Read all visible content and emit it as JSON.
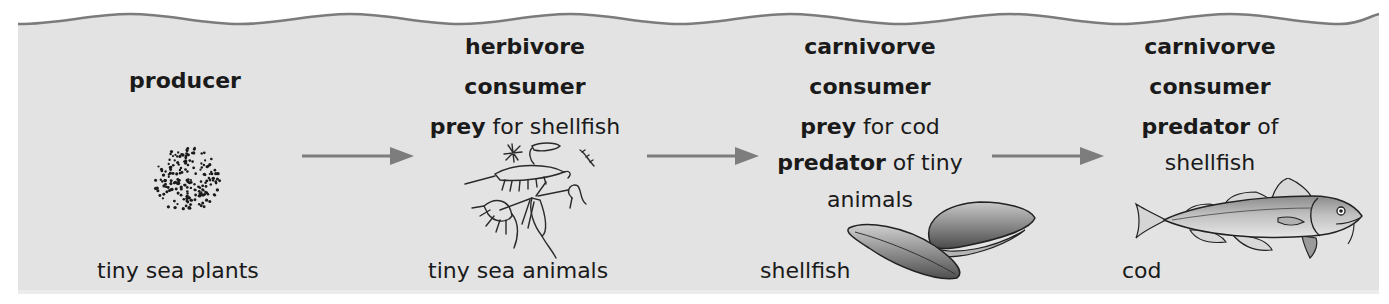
{
  "diagram": {
    "type": "food_chain",
    "colors": {
      "panel_fill": "#e3e3e3",
      "wave_stroke": "#7b7b7b",
      "arrow": "#7d7d7d",
      "text": "#1a1a1a"
    },
    "stages": [
      {
        "role_lines": [
          {
            "bold": "producer",
            "normal": ""
          }
        ],
        "organism_label": "tiny sea plants",
        "icon": "plankton-dots-icon"
      },
      {
        "role_lines": [
          {
            "bold": "herbivore",
            "normal": ""
          },
          {
            "bold": "consumer",
            "normal": ""
          },
          {
            "bold": "prey",
            "normal": " for shellfish"
          }
        ],
        "organism_label": "tiny sea animals",
        "icon": "zooplankton-icon"
      },
      {
        "role_lines": [
          {
            "bold": "carnivorve",
            "normal": ""
          },
          {
            "bold": "consumer",
            "normal": ""
          },
          {
            "bold": "prey",
            "normal": " for cod"
          },
          {
            "bold": "predator",
            "normal": " of tiny"
          },
          {
            "bold": "",
            "normal": "animals"
          }
        ],
        "organism_label": "shellfish",
        "icon": "mussel-icon"
      },
      {
        "role_lines": [
          {
            "bold": "carnivorve",
            "normal": ""
          },
          {
            "bold": "consumer",
            "normal": ""
          },
          {
            "bold": "predator",
            "normal": " of"
          },
          {
            "bold": "",
            "normal": "shellfish"
          }
        ],
        "organism_label": "cod",
        "icon": "cod-fish-icon"
      }
    ],
    "arrows": [
      {
        "from": 0,
        "to": 1,
        "icon": "arrow-right-icon"
      },
      {
        "from": 1,
        "to": 2,
        "icon": "arrow-right-icon"
      },
      {
        "from": 2,
        "to": 3,
        "icon": "arrow-right-icon"
      }
    ]
  }
}
